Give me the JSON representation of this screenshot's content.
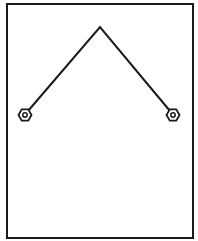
{
  "diagram": {
    "colors": {
      "background": "#ffffff",
      "stroke": "#1a1a1a"
    },
    "frame": {
      "x": 7,
      "y": 4,
      "width": 186,
      "height": 234
    },
    "wire": {
      "points": [
        [
          28,
          111
        ],
        [
          100,
          27
        ],
        [
          170,
          111
        ]
      ]
    },
    "terminals": [
      {
        "name": "left-terminal",
        "cx": 25,
        "cy": 115,
        "hex_radius": 6.5,
        "hole_radius": 2.2
      },
      {
        "name": "right-terminal",
        "cx": 173,
        "cy": 115,
        "hex_radius": 6.5,
        "hole_radius": 2.2
      }
    ]
  }
}
